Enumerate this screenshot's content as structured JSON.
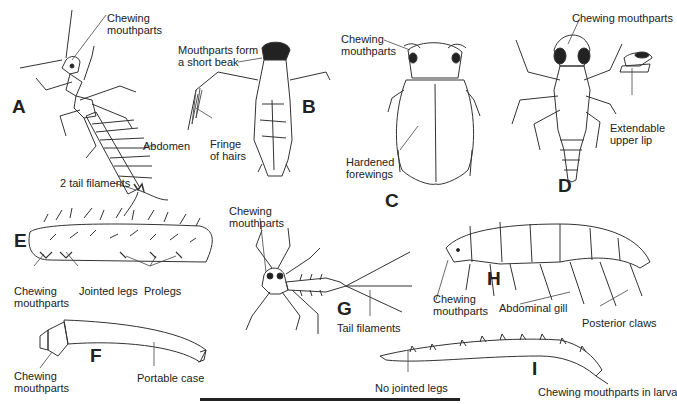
{
  "figures": [
    {
      "id": "A",
      "letter": "A",
      "labels": {
        "mouth": "Chewing\nmouthparts",
        "abdomen": "Abdomen",
        "tail": "2 tail filaments"
      }
    },
    {
      "id": "B",
      "letter": "B",
      "labels": {
        "beak": "Mouthparts form\na short beak",
        "hairs": "Fringe\nof hairs"
      }
    },
    {
      "id": "C",
      "letter": "C",
      "labels": {
        "mouth": "Chewing\nmouthparts",
        "wings": "Hardened\nforewings"
      }
    },
    {
      "id": "D",
      "letter": "D",
      "labels": {
        "mouth": "Chewing mouthparts",
        "lip": "Extendable\nupper lip"
      }
    },
    {
      "id": "E",
      "letter": "E",
      "labels": {
        "mouth": "Chewing\nmouthparts",
        "legs": "Jointed legs",
        "prolegs": "Prolegs"
      }
    },
    {
      "id": "F",
      "letter": "F",
      "labels": {
        "mouth": "Chewing\nmouthparts",
        "case": "Portable case"
      }
    },
    {
      "id": "G",
      "letter": "G",
      "labels": {
        "mouth": "Chewing\nmouthparts",
        "tail": "Tail filaments"
      }
    },
    {
      "id": "H",
      "letter": "H",
      "labels": {
        "mouth": "Chewing\nmouthparts",
        "gill": "Abdominal gill",
        "claws": "Posterior claws"
      }
    },
    {
      "id": "I",
      "letter": "I",
      "labels": {
        "legs": "No jointed legs",
        "mouth": "Chewing mouthparts in larva"
      }
    }
  ]
}
